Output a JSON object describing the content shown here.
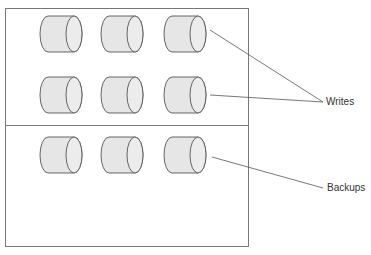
{
  "diagram": {
    "type": "storage-architecture",
    "colors": {
      "stroke": "#555555",
      "cylinder_fill": "#e6e6e6",
      "cylinder_face": "#ececec",
      "box_stroke": "#777777",
      "text": "#333333"
    },
    "container": {
      "x": 5,
      "y": 8,
      "width": 243,
      "height": 238,
      "divider_y": 125
    },
    "sections": [
      {
        "id": "writes-section",
        "rows": [
          {
            "y": 16
          },
          {
            "y": 77
          }
        ]
      },
      {
        "id": "backups-section",
        "rows": [
          {
            "y": 137
          }
        ]
      }
    ],
    "cylinder": {
      "width": 42,
      "height": 36,
      "columns_x": [
        40,
        101,
        164
      ]
    },
    "labels": {
      "writes": "Writes",
      "backups": "Backups"
    },
    "connectors": [
      {
        "from": [
          210,
          30
        ],
        "to": [
          323,
          102
        ],
        "label": "writes"
      },
      {
        "from": [
          210,
          95
        ],
        "to": [
          323,
          102
        ],
        "label": "writes"
      },
      {
        "from": [
          212,
          157
        ],
        "to": [
          323,
          188
        ],
        "label": "backups"
      }
    ]
  }
}
